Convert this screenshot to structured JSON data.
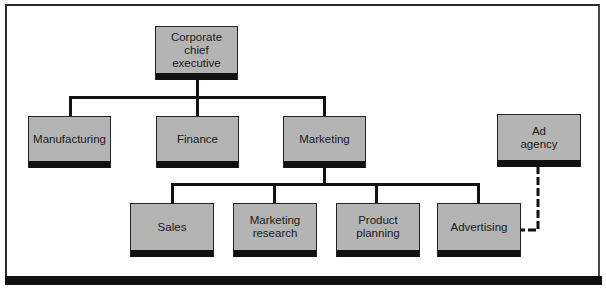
{
  "diagram": {
    "type": "organization-chart",
    "colors": {
      "box_fill": "#b4b4b4",
      "box_shadow": "#111111",
      "line": "#111111",
      "background": "#ffffff"
    },
    "nodes": {
      "ceo": {
        "label": "Corporate\nchief\nexecutive"
      },
      "manufacturing": {
        "label": "Manufacturing"
      },
      "finance": {
        "label": "Finance"
      },
      "marketing": {
        "label": "Marketing"
      },
      "ad_agency": {
        "label": "Ad\nagency"
      },
      "sales": {
        "label": "Sales"
      },
      "marketing_research": {
        "label": "Marketing\nresearch"
      },
      "product_planning": {
        "label": "Product\nplanning"
      },
      "advertising": {
        "label": "Advertising"
      }
    },
    "edges": [
      {
        "from": "Corporate chief executive",
        "to": "Manufacturing",
        "style": "solid"
      },
      {
        "from": "Corporate chief executive",
        "to": "Finance",
        "style": "solid"
      },
      {
        "from": "Corporate chief executive",
        "to": "Marketing",
        "style": "solid"
      },
      {
        "from": "Marketing",
        "to": "Sales",
        "style": "solid"
      },
      {
        "from": "Marketing",
        "to": "Marketing research",
        "style": "solid"
      },
      {
        "from": "Marketing",
        "to": "Product planning",
        "style": "solid"
      },
      {
        "from": "Marketing",
        "to": "Advertising",
        "style": "solid"
      },
      {
        "from": "Ad agency",
        "to": "Advertising",
        "style": "dashed"
      }
    ]
  }
}
